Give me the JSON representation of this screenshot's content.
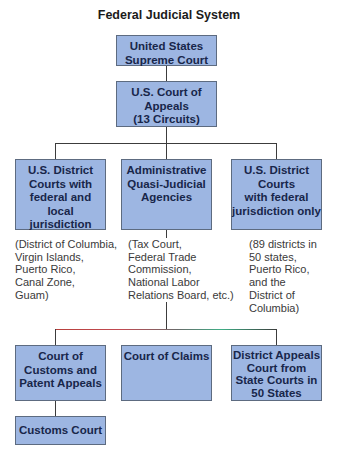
{
  "title": "Federal Judicial System",
  "colors": {
    "box_fill": "#9db6e2",
    "box_border": "#5d6b80",
    "box_text": "#18264a",
    "connector": "#3c3c3c"
  },
  "nodes": {
    "supreme_court": {
      "label": "United States\nSupreme Court"
    },
    "court_of_appeals": {
      "label": "U.S. Court of\nAppeals\n(13 Circuits)"
    },
    "district_fed_local": {
      "label": "U.S. District\nCourts with\nfederal and\nlocal\njurisdiction"
    },
    "admin_agencies": {
      "label": "Administrative\nQuasi-Judicial\nAgencies"
    },
    "district_fed_only": {
      "label": "U.S. District\nCourts\nwith federal\njurisdiction only"
    },
    "customs_patent_appeals": {
      "label": "Court of\nCustoms and\nPatent Appeals"
    },
    "court_of_claims": {
      "label": "Court of Claims"
    },
    "district_appeals_state": {
      "label": "District Appeals\nCourt from\nState Courts in\n50 States"
    },
    "customs_court": {
      "label": "Customs Court"
    }
  },
  "notes": {
    "district_fed_local": "(District of Columbia,\nVirgin Islands,\nPuerto Rico,\nCanal Zone,\nGuam)",
    "admin_agencies": "(Tax Court,\nFederal Trade\nCommission,\nNational Labor\nRelations Board, etc.)",
    "district_fed_only": "(89 districts in\n50 states,\nPuerto Rico,\nand the\nDistrict of\nColumbia)"
  },
  "edges": [
    [
      "supreme_court",
      "court_of_appeals"
    ],
    [
      "court_of_appeals",
      "district_fed_local"
    ],
    [
      "court_of_appeals",
      "admin_agencies"
    ],
    [
      "court_of_appeals",
      "district_fed_only"
    ],
    [
      "admin_agencies",
      "customs_patent_appeals"
    ],
    [
      "admin_agencies",
      "court_of_claims"
    ],
    [
      "admin_agencies",
      "district_appeals_state"
    ],
    [
      "customs_patent_appeals",
      "customs_court"
    ]
  ]
}
